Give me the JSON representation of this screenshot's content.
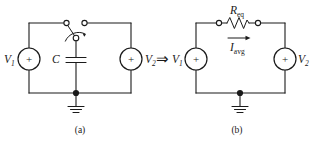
{
  "figure": {
    "background_color": "#ffffff",
    "ink_color": "#1a1a1a",
    "width": 312,
    "height": 143
  },
  "equivalence_operator": {
    "symbol": "⇒",
    "name": "implies"
  },
  "panels": [
    {
      "id": "a",
      "caption": "(a)",
      "name": "switched-capacitor-circuit",
      "sources": [
        {
          "id": "v1",
          "label": "V",
          "subscript": "1",
          "polarity": "+"
        },
        {
          "id": "v2",
          "label": "V",
          "subscript": "2",
          "polarity": "+"
        }
      ],
      "components": [
        {
          "id": "switch",
          "type": "spdt-switch",
          "label": "",
          "terminals": 3
        },
        {
          "id": "cap",
          "type": "capacitor",
          "label": "C",
          "subscript": ""
        }
      ],
      "ground": {
        "label": "",
        "type": "earth-ground"
      }
    },
    {
      "id": "b",
      "caption": "(b)",
      "name": "equivalent-resistor-circuit",
      "sources": [
        {
          "id": "v1",
          "label": "V",
          "subscript": "1",
          "polarity": "+"
        },
        {
          "id": "v2",
          "label": "V",
          "subscript": "2",
          "polarity": "+"
        }
      ],
      "components": [
        {
          "id": "req",
          "type": "resistor",
          "label": "R",
          "subscript": "eq"
        },
        {
          "id": "iavg",
          "type": "current-arrow",
          "label": "I",
          "subscript": "avg",
          "direction": "right"
        }
      ],
      "ground": {
        "label": "",
        "type": "earth-ground"
      }
    }
  ]
}
